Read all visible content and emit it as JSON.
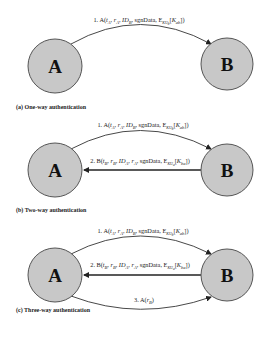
{
  "diagram": {
    "colors": {
      "node_fill": "#c8c8c8",
      "node_stroke": "#555555",
      "arrow": "#333333"
    },
    "panels": [
      {
        "id": "a",
        "caption": "(a) One-way authentication",
        "nodes": [
          {
            "label": "A",
            "cx": 55,
            "cy": 66,
            "r": 27
          },
          {
            "label": "B",
            "cx": 227,
            "cy": 64,
            "r": 26
          }
        ],
        "messages": [
          {
            "label": "1. A(tA, rA, IDB, sgnData, EKUb[Kab])",
            "from": "A",
            "to": "B"
          }
        ]
      },
      {
        "id": "b",
        "caption": "(b) Two-way authentication",
        "nodes": [
          {
            "label": "A",
            "cx": 55,
            "cy": 170,
            "r": 27
          },
          {
            "label": "B",
            "cx": 227,
            "cy": 170,
            "r": 26
          }
        ],
        "messages": [
          {
            "label": "1. A(tA, rA, IDB, sgnData, EKUb[Kab])",
            "from": "A",
            "to": "B"
          },
          {
            "label": "2. B(tB, rB, IDA, rA, sgnData, EKUa[Kba])",
            "from": "B",
            "to": "A"
          }
        ]
      },
      {
        "id": "c",
        "caption": "(c) Three-way authentication",
        "nodes": [
          {
            "label": "A",
            "cx": 55,
            "cy": 275,
            "r": 27
          },
          {
            "label": "B",
            "cx": 227,
            "cy": 275,
            "r": 26
          }
        ],
        "messages": [
          {
            "label": "1. A(tA, rA, IDB, sgnData, EKUb[Kab])",
            "from": "A",
            "to": "B"
          },
          {
            "label": "2. B(tB, rB, IDA, rA, sgnData, EKUa[Kba])",
            "from": "B",
            "to": "A"
          },
          {
            "label": "3. A(rB)",
            "from": "A",
            "to": "B"
          }
        ]
      }
    ]
  }
}
